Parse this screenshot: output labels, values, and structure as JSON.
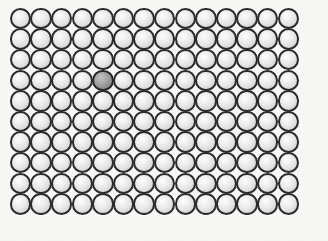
{
  "figure": {
    "kind": "lattice-diagram",
    "canvas": {
      "width": 328,
      "height": 241
    },
    "background_color": "#f9f9f8"
  },
  "lattice": {
    "columns": 14,
    "rows": 10,
    "total_atoms": 140,
    "origin_x": 20.5,
    "origin_y": 18.5,
    "spacing_x": 20.6,
    "spacing_y": 20.6,
    "atom_diameter": 21.5,
    "packing": "square",
    "outline_color": "#2b2b2b",
    "outline_width": 2.1
  },
  "atoms": {
    "host": {
      "label": "host atom",
      "count": 139,
      "fill_color": "#e6e6e6",
      "highlight_color": "#fdfdfd",
      "shadow_color": "#b4b4b4",
      "outline_color": "#2b2b2b"
    },
    "impurity": {
      "label": "impurity atom",
      "count": 1,
      "fill_color": "#9d9d9d",
      "highlight_color": "#c2c2c2",
      "shadow_color": "#6b6b6b",
      "outline_color": "#262626",
      "column_index": 4,
      "row_index": 3,
      "column_number": 5,
      "row_number": 4,
      "center_x": 108.9,
      "center_y": 92.3
    }
  }
}
